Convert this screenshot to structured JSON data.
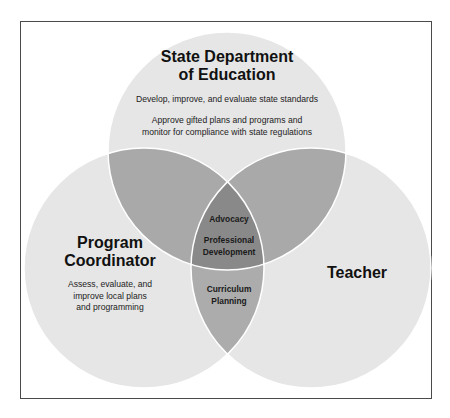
{
  "diagram": {
    "type": "venn",
    "colors": {
      "single": "#e6e6e6",
      "double": "#a9a9a9",
      "triple": "#898989",
      "outline": "#ffffff",
      "frame": "#4a4a4a"
    },
    "circles": {
      "top": {
        "title_line1": "State Department",
        "title_line2": "of Education",
        "item1": "Develop, improve, and evaluate state standards",
        "item2_line1": "Approve gifted plans and programs and",
        "item2_line2": "monitor for compliance with state regulations"
      },
      "left": {
        "title_line1": "Program",
        "title_line2": "Coordinator",
        "body_line1": "Assess, evaluate, and",
        "body_line2": "improve local plans",
        "body_line3": "and programming"
      },
      "right": {
        "title": "Teacher"
      }
    },
    "overlaps": {
      "center": {
        "item1": "Advocacy",
        "item2_line1": "Professional",
        "item2_line2": "Development"
      },
      "left_right": {
        "line1": "Curriculum",
        "line2": "Planning"
      }
    }
  }
}
